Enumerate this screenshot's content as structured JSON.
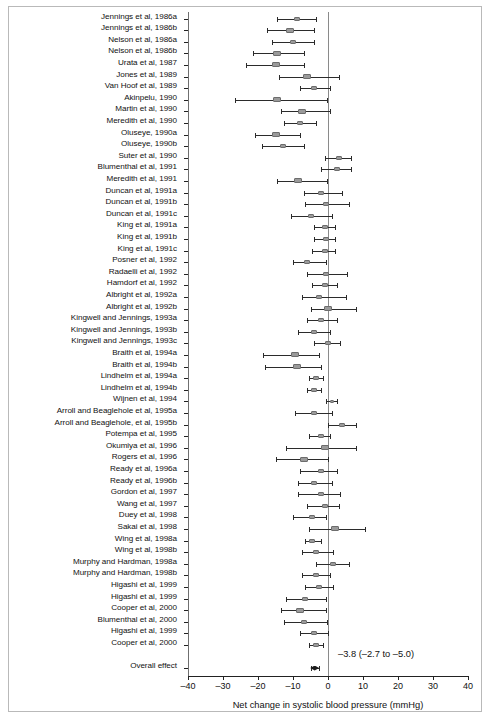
{
  "figure": {
    "xaxis_title": "Net change in systolic blood pressure (mmHg)",
    "overall_label": "Overall effect",
    "overall_text": "–3.8 (–2.7 to –5.0)"
  },
  "chart_data": {
    "type": "forest",
    "title": "",
    "xlabel": "Net change in systolic blood pressure (mmHg)",
    "ylabel": "",
    "xlim": [
      -40,
      40
    ],
    "xticks": [
      -40,
      -30,
      -20,
      -10,
      0,
      10,
      20,
      30,
      40
    ],
    "xticklabels": [
      "–40",
      "–30",
      "–20",
      "–10",
      "0",
      "10",
      "20",
      "30",
      "40"
    ],
    "grid": false,
    "legend": "none",
    "reference_line": 0,
    "effect_measure": "Net change in systolic blood pressure (mmHg)",
    "overall": {
      "label": "Overall effect",
      "estimate": -3.8,
      "ci_low": -5.0,
      "ci_high": -2.7,
      "annotation": "–3.8 (–2.7 to –5.0)"
    },
    "studies": [
      {
        "label": "Jennings et al, 1986a",
        "estimate": -9.0,
        "ci_low": -14.5,
        "ci_high": -3.5
      },
      {
        "label": "Jennings et al, 1986b",
        "estimate": -11.0,
        "ci_low": -17.5,
        "ci_high": -4.0
      },
      {
        "label": "Nelson et al, 1986a",
        "estimate": -10.0,
        "ci_low": -16.0,
        "ci_high": -4.0
      },
      {
        "label": "Nelson et al, 1986b",
        "estimate": -14.5,
        "ci_low": -21.5,
        "ci_high": -7.0
      },
      {
        "label": "Urata et al, 1987",
        "estimate": -15.0,
        "ci_low": -23.5,
        "ci_high": -7.0
      },
      {
        "label": "Jones et al, 1989",
        "estimate": -6.0,
        "ci_low": -14.0,
        "ci_high": 3.0
      },
      {
        "label": "Van Hoof et al, 1989",
        "estimate": -4.0,
        "ci_low": -8.0,
        "ci_high": 0.5
      },
      {
        "label": "Akinpelu, 1990",
        "estimate": -14.5,
        "ci_low": -26.5,
        "ci_high": -0.2
      },
      {
        "label": "Martin et al, 1990",
        "estimate": -7.5,
        "ci_low": -13.5,
        "ci_high": 0.5
      },
      {
        "label": "Meredith et al, 1990",
        "estimate": -8.0,
        "ci_low": -12.5,
        "ci_high": -3.5
      },
      {
        "label": "Oluseye, 1990a",
        "estimate": -15.0,
        "ci_low": -21.0,
        "ci_high": -8.0
      },
      {
        "label": "Oluseye, 1990b",
        "estimate": -13.0,
        "ci_low": -19.0,
        "ci_high": -7.0
      },
      {
        "label": "Suter et al, 1990",
        "estimate": 3.0,
        "ci_low": -1.0,
        "ci_high": 6.5
      },
      {
        "label": "Blumenthal et al, 1991",
        "estimate": 2.5,
        "ci_low": -2.0,
        "ci_high": 6.5
      },
      {
        "label": "Meredith et al, 1991",
        "estimate": -8.5,
        "ci_low": -14.5,
        "ci_high": -0.2
      },
      {
        "label": "Duncan et al, 1991a",
        "estimate": -2.0,
        "ci_low": -7.0,
        "ci_high": 4.0
      },
      {
        "label": "Duncan et al, 1991b",
        "estimate": -0.5,
        "ci_low": -6.5,
        "ci_high": 6.0
      },
      {
        "label": "Duncan et al, 1991c",
        "estimate": -5.0,
        "ci_low": -10.5,
        "ci_high": 1.0
      },
      {
        "label": "King et al, 1991a",
        "estimate": -1.0,
        "ci_low": -4.0,
        "ci_high": 2.0
      },
      {
        "label": "King et al, 1991b",
        "estimate": -0.5,
        "ci_low": -4.0,
        "ci_high": 2.0
      },
      {
        "label": "King et al, 1991c",
        "estimate": -1.0,
        "ci_low": -4.5,
        "ci_high": 2.0
      },
      {
        "label": "Posner et al, 1992",
        "estimate": -6.0,
        "ci_low": -10.0,
        "ci_high": -0.5
      },
      {
        "label": "Radaelli et al, 1992",
        "estimate": -0.5,
        "ci_low": -6.0,
        "ci_high": 5.5
      },
      {
        "label": "Hamdorf et al, 1992",
        "estimate": -1.0,
        "ci_low": -4.5,
        "ci_high": 2.5
      },
      {
        "label": "Albright et al, 1992a",
        "estimate": -2.5,
        "ci_low": -7.5,
        "ci_high": 5.0
      },
      {
        "label": "Albright et al, 1992b",
        "estimate": 0.0,
        "ci_low": -5.0,
        "ci_high": 8.0
      },
      {
        "label": "Kingwell and Jennings, 1993a",
        "estimate": -2.0,
        "ci_low": -6.0,
        "ci_high": 2.5
      },
      {
        "label": "Kingwell and Jennings, 1993b",
        "estimate": -4.0,
        "ci_low": -8.5,
        "ci_high": 0.5
      },
      {
        "label": "Kingwell and Jennings, 1993c",
        "estimate": 0.0,
        "ci_low": -4.0,
        "ci_high": 3.5
      },
      {
        "label": "Braith et al, 1994a",
        "estimate": -9.5,
        "ci_low": -18.5,
        "ci_high": -2.5
      },
      {
        "label": "Braith et al, 1994b",
        "estimate": -9.0,
        "ci_low": -18.0,
        "ci_high": -2.0
      },
      {
        "label": "Lindhelm et al, 1994a",
        "estimate": -3.5,
        "ci_low": -5.5,
        "ci_high": -1.5
      },
      {
        "label": "Lindhelm et al, 1994b",
        "estimate": -4.0,
        "ci_low": -6.0,
        "ci_high": -2.0
      },
      {
        "label": "Wijnen et al, 1994",
        "estimate": 1.0,
        "ci_low": -0.5,
        "ci_high": 2.5
      },
      {
        "label": "Arroll and Beaglehole et al, 1995a",
        "estimate": -4.0,
        "ci_low": -9.5,
        "ci_high": 1.0
      },
      {
        "label": "Arroll and Beaglehole, et al, 1995b",
        "estimate": 4.0,
        "ci_low": 0.0,
        "ci_high": 8.0
      },
      {
        "label": "Potempa et al, 1995",
        "estimate": -2.0,
        "ci_low": -5.5,
        "ci_high": 0.5
      },
      {
        "label": "Okumiya et al, 1996",
        "estimate": -1.0,
        "ci_low": -12.0,
        "ci_high": 8.0
      },
      {
        "label": "Rogers et al, 1996",
        "estimate": -7.0,
        "ci_low": -15.0,
        "ci_high": 0.0
      },
      {
        "label": "Ready et al, 1996a",
        "estimate": -2.0,
        "ci_low": -8.0,
        "ci_high": 2.5
      },
      {
        "label": "Ready et al, 1996b",
        "estimate": -4.0,
        "ci_low": -8.5,
        "ci_high": 1.0
      },
      {
        "label": "Gordon et al, 1997",
        "estimate": -2.0,
        "ci_low": -8.5,
        "ci_high": 3.5
      },
      {
        "label": "Wang et al, 1997",
        "estimate": -1.0,
        "ci_low": -6.0,
        "ci_high": 3.0
      },
      {
        "label": "Duey et al, 1998",
        "estimate": -4.5,
        "ci_low": -10.0,
        "ci_high": -0.5
      },
      {
        "label": "Sakai et al, 1998",
        "estimate": 2.0,
        "ci_low": -5.5,
        "ci_high": 10.5
      },
      {
        "label": "Wing et al, 1998a",
        "estimate": -4.5,
        "ci_low": -6.5,
        "ci_high": -2.0
      },
      {
        "label": "Wing et al, 1998b",
        "estimate": -3.5,
        "ci_low": -7.5,
        "ci_high": 1.5
      },
      {
        "label": "Murphy and Hardman, 1998a",
        "estimate": 1.5,
        "ci_low": -3.5,
        "ci_high": 6.0
      },
      {
        "label": "Murphy and Hardman, 1998b",
        "estimate": -3.5,
        "ci_low": -7.5,
        "ci_high": 0.5
      },
      {
        "label": "Higashi et al, 1999",
        "estimate": -2.5,
        "ci_low": -6.5,
        "ci_high": 1.5
      },
      {
        "label": "Higashi et al, 1999",
        "estimate": -6.5,
        "ci_low": -12.0,
        "ci_high": -0.5
      },
      {
        "label": "Cooper et al, 2000",
        "estimate": -8.0,
        "ci_low": -13.5,
        "ci_high": -0.5
      },
      {
        "label": "Blumenthal et al, 2000",
        "estimate": -7.0,
        "ci_low": -12.5,
        "ci_high": -0.2
      },
      {
        "label": "Higashi et al, 1999 ",
        "estimate": -4.0,
        "ci_low": -8.0,
        "ci_high": 0.0
      },
      {
        "label": "Cooper et al, 2000 ",
        "estimate": -3.5,
        "ci_low": -5.5,
        "ci_high": -1.5
      }
    ]
  }
}
